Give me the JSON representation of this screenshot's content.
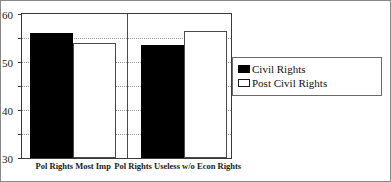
{
  "chart_data": {
    "type": "bar",
    "title": "",
    "subtitle": "",
    "xlabel": "",
    "ylabel": "",
    "ylim": [
      0,
      60
    ],
    "ytick_labels": [
      "0",
      "10",
      "20",
      "30",
      "40",
      "50",
      "60"
    ],
    "ytick_values": [
      0,
      10,
      20,
      30,
      40,
      50,
      60
    ],
    "grid": true,
    "grid_axis": "y",
    "grid_style": "dotted",
    "legend_position": "right",
    "categories": [
      "Pol Rights Most Imp",
      "Pol Rights Useless w/o Econ Rights"
    ],
    "series": [
      {
        "name": "Civil Rights",
        "swatch": "filled",
        "color": "#000000",
        "values": [
          52,
          47
        ]
      },
      {
        "name": "Post Civil Rights",
        "swatch": "hollow",
        "color": "#ffffff",
        "values": [
          48,
          53
        ]
      }
    ]
  },
  "legend": {
    "entries": [
      {
        "label": "Civil Rights",
        "swatch": "filled"
      },
      {
        "label": "Post Civil Rights",
        "swatch": "hollow"
      }
    ]
  },
  "colors": {
    "figure_border": "#8a8a8a",
    "plot_border": "#3a3a3a",
    "gridline": "#9a9a9a",
    "series_civil_rights": "#000000",
    "series_post_civil_rights": "#ffffff",
    "text": "#1a1a1a"
  }
}
